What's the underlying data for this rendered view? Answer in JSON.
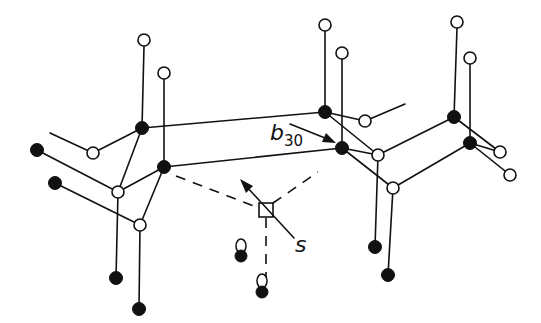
{
  "figure": {
    "labels": {
      "bond_label_main": "b",
      "bond_label_sub": "30",
      "site_label": "s"
    },
    "colors": {
      "ink": "#111111",
      "background": "#ffffff"
    }
  },
  "nodes": {
    "open": [
      {
        "x": 144,
        "y": 40
      },
      {
        "x": 164,
        "y": 73
      },
      {
        "x": 93,
        "y": 153
      },
      {
        "x": 118,
        "y": 192
      },
      {
        "x": 140,
        "y": 225
      },
      {
        "x": 325,
        "y": 25
      },
      {
        "x": 342,
        "y": 53
      },
      {
        "x": 365,
        "y": 121
      },
      {
        "x": 378,
        "y": 155
      },
      {
        "x": 393,
        "y": 188
      },
      {
        "x": 457,
        "y": 22
      },
      {
        "x": 470,
        "y": 58
      },
      {
        "x": 500,
        "y": 152
      },
      {
        "x": 510,
        "y": 175
      }
    ],
    "filled": [
      {
        "x": 142,
        "y": 128
      },
      {
        "x": 164,
        "y": 167
      },
      {
        "x": 37,
        "y": 150
      },
      {
        "x": 55,
        "y": 183
      },
      {
        "x": 116,
        "y": 278
      },
      {
        "x": 139,
        "y": 309
      },
      {
        "x": 325,
        "y": 112
      },
      {
        "x": 342,
        "y": 148
      },
      {
        "x": 375,
        "y": 247
      },
      {
        "x": 388,
        "y": 275
      },
      {
        "x": 454,
        "y": 117
      },
      {
        "x": 470,
        "y": 143
      }
    ]
  }
}
